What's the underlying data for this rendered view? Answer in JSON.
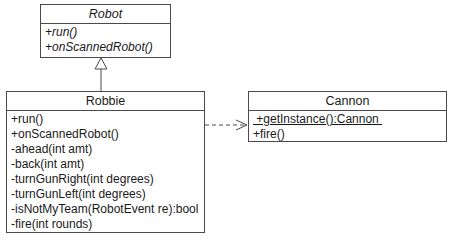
{
  "diagram": {
    "type": "uml-class-diagram",
    "classes": [
      {
        "id": "robot",
        "name": "Robot",
        "abstract": true,
        "operations": [
          {
            "text": "+run()",
            "abstract": true
          },
          {
            "text": "+onScannedRobot()",
            "abstract": true
          }
        ]
      },
      {
        "id": "robbie",
        "name": "Robbie",
        "abstract": false,
        "operations": [
          {
            "text": "+run()"
          },
          {
            "text": "+onScannedRobot()"
          },
          {
            "text": "-ahead(int amt)"
          },
          {
            "text": "-back(int amt)"
          },
          {
            "text": "-turnGunRight(int degrees)"
          },
          {
            "text": "-turnGunLeft(int degrees)"
          },
          {
            "text": "-isNotMyTeam(RobotEvent re):bool"
          },
          {
            "text": "-fire(int rounds)"
          }
        ]
      },
      {
        "id": "cannon",
        "name": "Cannon",
        "abstract": false,
        "operations": [
          {
            "text": " +getInstance():Cannon ",
            "static": true
          },
          {
            "text": "+fire()"
          }
        ]
      }
    ],
    "relationships": [
      {
        "type": "generalization",
        "from": "Robbie",
        "to": "Robot"
      },
      {
        "type": "dependency",
        "from": "Robbie",
        "to": "Cannon"
      }
    ]
  }
}
